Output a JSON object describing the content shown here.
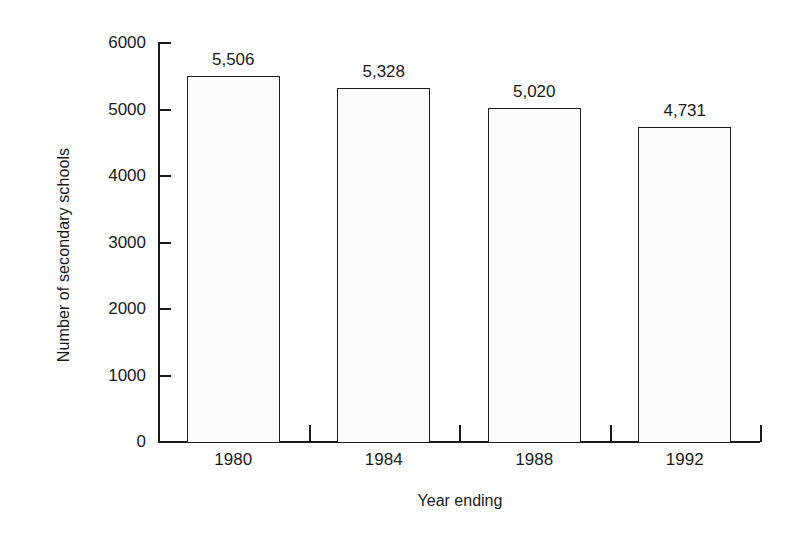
{
  "chart_data": {
    "type": "bar",
    "title": "",
    "subtitle": "",
    "xlabel": "Year ending",
    "ylabel": "Number of secondary schools",
    "categories": [
      "1980",
      "1984",
      "1988",
      "1992"
    ],
    "values": [
      5506,
      5328,
      5020,
      4731
    ],
    "value_labels": [
      "5,506",
      "5,328",
      "5,020",
      "4,731"
    ],
    "series": [
      {
        "name": "Number of secondary schools",
        "values": [
          5506,
          5328,
          5020,
          4731
        ]
      }
    ],
    "ylim": [
      0,
      6000
    ],
    "y_ticks": [
      0,
      1000,
      2000,
      3000,
      4000,
      5000,
      6000
    ],
    "y_tick_labels": [
      "0",
      "1000",
      "2000",
      "3000",
      "4000",
      "5000",
      "6000"
    ],
    "grid": false,
    "legend": false,
    "legend_position": "none",
    "bar_fill_color": "#fcfcfc",
    "bar_border_color": "#1a1a1a",
    "axis_color": "#1a1a1a",
    "background_color": "#ffffff"
  }
}
